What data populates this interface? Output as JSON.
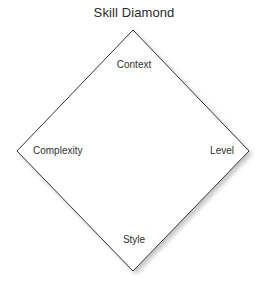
{
  "diagram": {
    "title": "Skill Diamond",
    "type": "diamond",
    "shape": {
      "fill_color": "#ffffff",
      "stroke_color": "#333333",
      "stroke_width": 1,
      "shadow_color": "#b4b4b4",
      "vertices": {
        "top": {
          "x": 133,
          "y": 30
        },
        "right": {
          "x": 249,
          "y": 151
        },
        "bottom": {
          "x": 133,
          "y": 271
        },
        "left": {
          "x": 17,
          "y": 151
        }
      }
    },
    "labels": {
      "top": "Context",
      "left": "Complexity",
      "right": "Level",
      "bottom": "Style"
    },
    "text_color": "#303030",
    "title_color": "#2b2b2b",
    "background_color": "#ffffff"
  }
}
